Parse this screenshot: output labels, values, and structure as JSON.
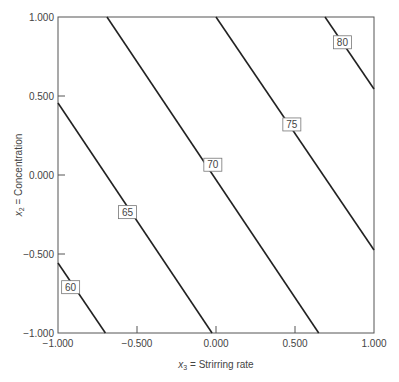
{
  "chart_data": {
    "type": "line",
    "subtype": "contour",
    "title": "",
    "xlabel_var": "x",
    "xlabel_sub": "3",
    "xlabel_text": " = Strirring rate",
    "ylabel_var": "x",
    "ylabel_sub": "2",
    "ylabel_text": " = Concentration",
    "xlim": [
      -1.0,
      1.0
    ],
    "ylim": [
      -1.0,
      1.0
    ],
    "x_ticks": [
      "-1.000",
      "-0.500",
      "0.000",
      "0.500",
      "1.000"
    ],
    "y_ticks": [
      "1.000",
      "0.500",
      "0.000",
      "-0.500",
      "-1.000"
    ],
    "grid": false,
    "series": [
      {
        "name": "60",
        "points": [
          [
            -1.0,
            -0.557
          ],
          [
            -0.7,
            -1.0
          ]
        ],
        "label_at": [
          -0.92,
          -0.71
        ]
      },
      {
        "name": "65",
        "points": [
          [
            -1.0,
            0.456
          ],
          [
            -0.025,
            -1.0
          ]
        ],
        "label_at": [
          -0.56,
          -0.235
        ]
      },
      {
        "name": "70",
        "points": [
          [
            -0.69,
            1.0
          ],
          [
            0.65,
            -1.0
          ]
        ],
        "label_at": [
          -0.02,
          0.065
        ]
      },
      {
        "name": "75",
        "points": [
          [
            0.0,
            1.0
          ],
          [
            1.0,
            -0.475
          ]
        ],
        "label_at": [
          0.48,
          0.32
        ]
      },
      {
        "name": "80",
        "points": [
          [
            0.69,
            1.0
          ],
          [
            1.0,
            0.544
          ]
        ],
        "label_at": [
          0.8,
          0.84
        ]
      }
    ]
  }
}
